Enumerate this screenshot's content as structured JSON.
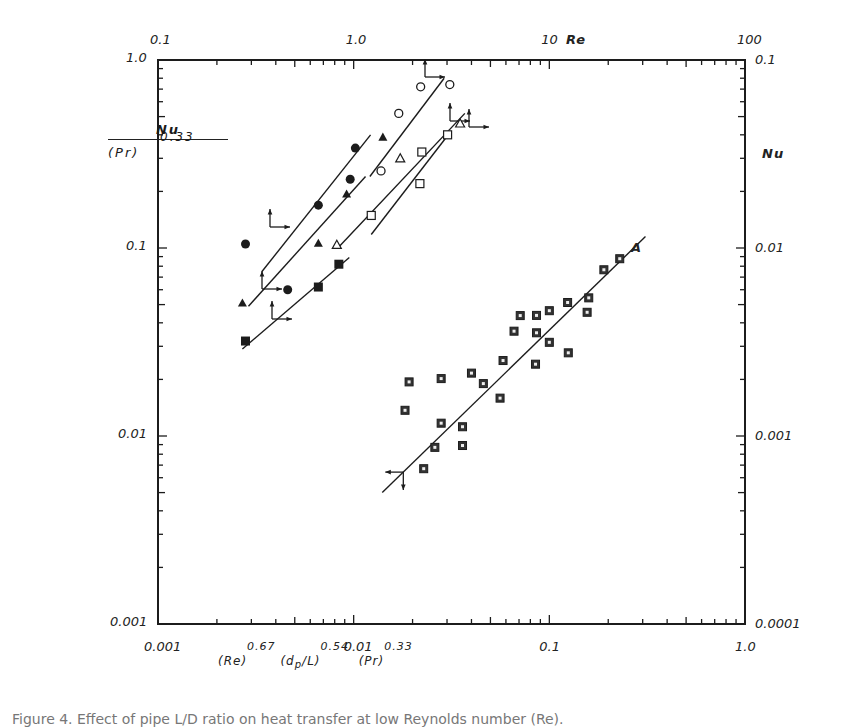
{
  "chart_data": {
    "type": "scatter",
    "title": "",
    "xlabel": "(Re)^0.67 (d_p/L)^0.54 (Pr)^0.33",
    "ylabel": "Nu / (Pr)^0.33",
    "xscale": "log",
    "yscale": "log",
    "xlim": [
      0.001,
      1.0
    ],
    "ylim": [
      0.001,
      1.0
    ],
    "x_ticks": [
      "0.001",
      "0.01",
      "0.1",
      "1.0"
    ],
    "y_ticks": [
      "0.001",
      "0.01",
      "0.1",
      "1.0"
    ],
    "top_axis": {
      "label": "Re",
      "ticks": [
        "0.1",
        "1.0",
        "10",
        "100"
      ],
      "range": [
        0.1,
        100
      ]
    },
    "right_axis": {
      "label": "Nu",
      "ticks": [
        "0.0001",
        "0.001",
        "0.01",
        "0.1"
      ],
      "range": [
        0.0001,
        0.1
      ]
    },
    "grid": false,
    "annotations": [
      {
        "text": "A",
        "x": 0.24,
        "y": 0.11
      }
    ],
    "series": [
      {
        "name": "filled-circle",
        "marker": "filled-circle",
        "x": [
          0.0028,
          0.0046,
          0.0066,
          0.0096,
          0.0102
        ],
        "y": [
          0.105,
          0.06,
          0.169,
          0.232,
          0.34
        ]
      },
      {
        "name": "filled-triangle",
        "marker": "filled-triangle",
        "x": [
          0.0027,
          0.0066,
          0.0092,
          0.0141
        ],
        "y": [
          0.051,
          0.106,
          0.194,
          0.389
        ]
      },
      {
        "name": "open-triangle",
        "marker": "open-triangle",
        "x": [
          0.0082,
          0.0173,
          0.035
        ],
        "y": [
          0.104,
          0.3,
          0.46
        ]
      },
      {
        "name": "open-circle",
        "marker": "open-circle",
        "x": [
          0.0138,
          0.017,
          0.022,
          0.031
        ],
        "y": [
          0.257,
          0.52,
          0.72,
          0.74
        ]
      },
      {
        "name": "open-square",
        "marker": "open-square",
        "x": [
          0.0123,
          0.0218,
          0.0223,
          0.0302
        ],
        "y": [
          0.149,
          0.22,
          0.324,
          0.4
        ]
      },
      {
        "name": "filled-square",
        "marker": "filled-square",
        "x": [
          0.0028,
          0.0066,
          0.0084
        ],
        "y": [
          0.032,
          0.062,
          0.082
        ]
      },
      {
        "name": "A (checked-square)",
        "marker": "checked-square",
        "x": [
          0.0183,
          0.0192,
          0.0228,
          0.026,
          0.028,
          0.028,
          0.036,
          0.036,
          0.04,
          0.046,
          0.056,
          0.058,
          0.066,
          0.071,
          0.085,
          0.086,
          0.086,
          0.1,
          0.1,
          0.125,
          0.124,
          0.156,
          0.159,
          0.19,
          0.229
        ],
        "y": [
          0.0137,
          0.0194,
          0.0067,
          0.0087,
          0.0117,
          0.0202,
          0.0112,
          0.0089,
          0.0216,
          0.019,
          0.0159,
          0.0252,
          0.0361,
          0.0437,
          0.0241,
          0.0354,
          0.0438,
          0.0315,
          0.0464,
          0.0277,
          0.0513,
          0.0455,
          0.0543,
          0.0766,
          0.0877
        ]
      }
    ],
    "fit_lines": [
      {
        "name": "line-A",
        "from": [
          0.014,
          0.005
        ],
        "to": [
          0.31,
          0.115
        ],
        "arrow_end": "left-down"
      },
      {
        "name": "filled-circle-fit",
        "from": [
          0.0034,
          0.075
        ],
        "to": [
          0.0122,
          0.4
        ],
        "arrow_end": "up-right"
      },
      {
        "name": "filled-triangle-fit",
        "from": [
          0.0029,
          0.049
        ],
        "to": [
          0.0115,
          0.24
        ],
        "arrow_end": "up-right"
      },
      {
        "name": "filled-square-fit",
        "from": [
          0.0027,
          0.029
        ],
        "to": [
          0.0095,
          0.089
        ],
        "arrow_end": "up-right"
      },
      {
        "name": "open-triangle-fit",
        "from": [
          0.0083,
          0.1
        ],
        "to": [
          0.037,
          0.52
        ],
        "arrow_end": "up-right"
      },
      {
        "name": "open-circle-fit",
        "from": [
          0.0121,
          0.24
        ],
        "to": [
          0.029,
          0.8
        ],
        "arrow_end": "up-right"
      },
      {
        "name": "open-square-fit",
        "from": [
          0.0123,
          0.118
        ],
        "to": [
          0.031,
          0.41
        ],
        "arrow_end": "up-right"
      }
    ]
  },
  "labels": {
    "top_axis_label": "Re",
    "right_axis_label": "Nu",
    "y_frac_num": "Nu",
    "y_frac_den": "(Pr)",
    "y_frac_exp": "0.33",
    "x_title_re": "(Re)",
    "x_title_re_exp": "0.67",
    "x_title_dp": "(d",
    "x_title_dp_sub": "p",
    "x_title_dp_rest": "/L)",
    "x_title_dp_exp": "0.54",
    "x_title_pr": "(Pr)",
    "x_title_pr_exp": "0.33",
    "annotation_a": "A",
    "caption": "Figure 4.  Effect of pipe L/D ratio on heat transfer at low Reynolds number (Re)."
  }
}
